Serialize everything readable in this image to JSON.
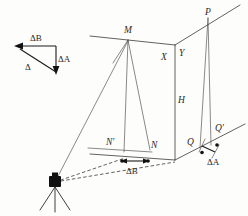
{
  "figure": {
    "background_color": "#fdfdfc",
    "line_color": "#3a3a3a",
    "label_color": "#2a2a2a",
    "vector_color": "#1a1a1a"
  },
  "vector_triangle": {
    "name": "error-vector-triangle",
    "labels": {
      "delta_b": "ΔB",
      "delta_a": "ΔA",
      "delta": "Δ"
    }
  },
  "points": {
    "m": "M",
    "n": "N",
    "n_prime": "N′",
    "p": "P",
    "q": "Q",
    "q_prime": "Q′"
  },
  "dimensions": {
    "x": "X",
    "y": "Y",
    "h": "H"
  },
  "measures": {
    "delta_b_base": "ΔB",
    "delta_a_base": "ΔA"
  },
  "instrument": {
    "name": "theodolite-on-tripod",
    "label": ""
  }
}
